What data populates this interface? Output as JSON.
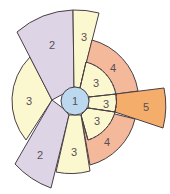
{
  "diagram": {
    "colors": {
      "center": "#bcd8ef",
      "level2": "#ddd4e6",
      "level3": "#fbf8cf",
      "level4": "#f4b89a",
      "level5": "#f5ad6c",
      "stroke": "#4a3f45"
    },
    "center": {
      "label": "1"
    },
    "segments": [
      {
        "id": "purple-upper",
        "label": "2"
      },
      {
        "id": "purple-lower",
        "label": "2"
      },
      {
        "id": "yellow-left",
        "label": "3"
      },
      {
        "id": "yellow-top",
        "label": "3"
      },
      {
        "id": "yellow-bottom",
        "label": "3"
      },
      {
        "id": "yellow-inner-upper",
        "label": "3"
      },
      {
        "id": "yellow-inner-middle",
        "label": "3"
      },
      {
        "id": "yellow-inner-lower",
        "label": "3"
      },
      {
        "id": "salmon-upper",
        "label": "4"
      },
      {
        "id": "salmon-lower",
        "label": "4"
      },
      {
        "id": "orange-wedge",
        "label": "5"
      }
    ]
  }
}
